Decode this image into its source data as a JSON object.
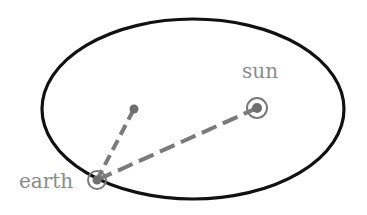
{
  "diagram": {
    "labels": {
      "sun": "sun",
      "earth": "earth"
    },
    "colors": {
      "orbit": "#111111",
      "marker": "#7a7a7a",
      "label": "#8a8a8a",
      "background": "#ffffff"
    },
    "orbit": {
      "cx": 193,
      "cy": 109,
      "rx": 151,
      "ry": 90
    },
    "sun": {
      "x": 257,
      "y": 108,
      "ring_r": 10,
      "dot_r": 5
    },
    "center_focus": {
      "x": 134,
      "y": 109,
      "dot_r": 4.5
    },
    "earth": {
      "x": 97,
      "y": 180,
      "ring_r": 9,
      "dot_r": 4.5
    }
  }
}
